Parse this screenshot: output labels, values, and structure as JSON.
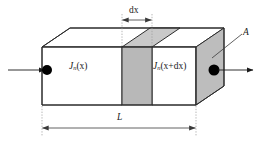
{
  "figure": {
    "name": "semiconductor-bar-current-continuity-diagram",
    "background_color": "#ffffff"
  },
  "labels": {
    "current_in": {
      "symbol": "J",
      "subscript": "n",
      "argument": "(x)",
      "full_text": "Jn(x)"
    },
    "current_out": {
      "symbol": "J",
      "subscript": "n",
      "argument": "(x+dx)",
      "full_text": "Jn(x+dx)"
    },
    "slab_thickness": "dx",
    "cross_section_area": "A",
    "bar_length": "L"
  },
  "colors": {
    "outline": "#2b2b2b",
    "slab_fill": "#b8b8b8",
    "end_face_fill": "#bdbdbd",
    "top_slab_fill": "#c9c9c9",
    "hidden_edge": "#9a9a9a",
    "dimension_line": "#4a4a4a",
    "extension_line": "#9a9a9a",
    "marker_dot": "#000000",
    "flow_arrow": "#1a1a1a",
    "leader_line": "#3a3a3a"
  },
  "geometry": {
    "front_face_left_x": 42,
    "front_face_right_x": 196,
    "front_face_top_y": 47,
    "front_face_bottom_y": 105,
    "depth_offset_x": 28,
    "depth_offset_y": 19,
    "slab_front_left_x": 122,
    "slab_front_right_x": 152,
    "dx_dimension_y": 20,
    "l_dimension_y": 128
  },
  "markers": {
    "inlet_dot": {
      "cx": 47,
      "cy": 70,
      "r": 5
    },
    "outlet_dot": {
      "cx": 214,
      "cy": 70,
      "r": 5.5
    }
  },
  "arrows": {
    "inlet": {
      "x1": 8,
      "y1": 70,
      "x2": 46,
      "y2": 70
    },
    "outlet": {
      "x1": 215,
      "y1": 70,
      "x2": 254,
      "y2": 70
    }
  }
}
